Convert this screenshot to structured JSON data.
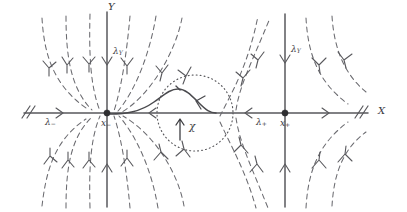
{
  "figure": {
    "type": "phase-portrait"
  },
  "axes": {
    "x_label": "X",
    "y_label": "Y",
    "x_axis_name": "horizontal-axis",
    "y_axis_name": "vertical-axis",
    "hash_glyph": "//",
    "hash_left_name": "axis-break-left",
    "hash_right_name": "axis-break-right"
  },
  "fixed_points": [
    {
      "id": "x-minus",
      "label_base": "x",
      "label_sub": "−",
      "kind": "stable-node",
      "cx": 107,
      "cy": 113
    },
    {
      "id": "x-plus",
      "label_base": "x",
      "label_sub": "+",
      "kind": "saddle",
      "cx": 285,
      "cy": 113
    }
  ],
  "eigenvalue_labels": [
    {
      "id": "lambda-minus",
      "base": "λ",
      "sub": "−",
      "sub_italic": false,
      "x": 47,
      "y": 120
    },
    {
      "id": "lambda-plus",
      "base": "λ",
      "sub": "+",
      "sub_italic": false,
      "x": 257,
      "y": 120
    },
    {
      "id": "lambda-y-left",
      "base": "λ",
      "sub": "Y",
      "sub_italic": true,
      "x": 115,
      "y": 52
    },
    {
      "id": "lambda-y-right",
      "base": "λ",
      "sub": "Y",
      "sub_italic": true,
      "x": 293,
      "y": 50
    }
  ],
  "region": {
    "id": "chi-region",
    "label": "χ",
    "label_x": 193,
    "label_y": 123,
    "circle_cx": 195,
    "circle_cy": 113,
    "circle_r": 38,
    "arrow_name": "chi-direction-arrow"
  },
  "curves": {
    "heteroclinic_name": "heteroclinic-bump-orbit",
    "dashed_name": "flow-trajectory",
    "arrowhead_name": "flow-arrowhead"
  },
  "colors": {
    "axis": "#58585c",
    "dashed_flow": "#6b6b70",
    "solid_flow": "#4a4a4e",
    "fixed_point": "#2e2e31",
    "label": "#3a3a3e",
    "background": "#ffffff"
  }
}
